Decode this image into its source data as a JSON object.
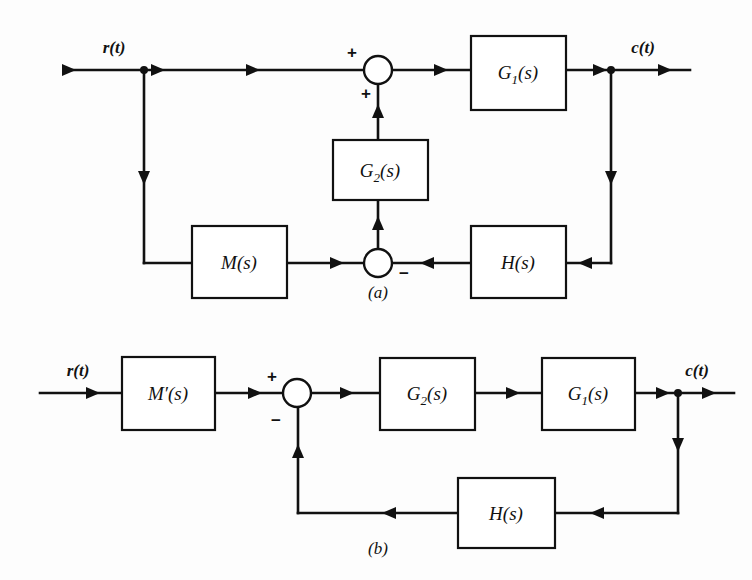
{
  "figure": {
    "background_color": "#fdfdfd",
    "line_color": "#111111",
    "block_fill": "#ffffff"
  },
  "diagram_a": {
    "caption": "(a)",
    "input_label": "r(t)",
    "output_label": "c(t)",
    "blocks": [
      {
        "id": "g1",
        "label_main": "G",
        "label_sub": "1",
        "label_tail": "(s)",
        "text": "G1(s)",
        "x": 471,
        "y": 36,
        "w": 95,
        "h": 74
      },
      {
        "id": "g2",
        "label_main": "G",
        "label_sub": "2",
        "label_tail": "(s)",
        "text": "G2(s)",
        "x": 333,
        "y": 140,
        "w": 95,
        "h": 60
      },
      {
        "id": "m",
        "label_main": "M",
        "label_sub": "",
        "label_tail": "(s)",
        "text": "M(s)",
        "x": 192,
        "y": 226,
        "w": 95,
        "h": 72
      },
      {
        "id": "h",
        "label_main": "H",
        "label_sub": "",
        "label_tail": "(s)",
        "text": "H(s)",
        "x": 471,
        "y": 226,
        "w": 95,
        "h": 72
      }
    ],
    "summing_junctions": [
      {
        "id": "sum-top",
        "cx": 378,
        "cy": 70,
        "r": 14,
        "signs": [
          {
            "text": "+",
            "x": 352,
            "y": 58
          },
          {
            "text": "+",
            "x": 366,
            "y": 99
          }
        ]
      },
      {
        "id": "sum-bottom",
        "cx": 378,
        "cy": 263,
        "r": 14,
        "signs": [
          {
            "text": "−",
            "x": 402,
            "y": 278
          }
        ]
      }
    ],
    "branch_points": [
      {
        "id": "r-branch",
        "cx": 144,
        "cy": 70
      },
      {
        "id": "c-branch",
        "cx": 611,
        "cy": 70
      }
    ]
  },
  "diagram_b": {
    "caption": "(b)",
    "input_label": "r(t)",
    "output_label": "c(t)",
    "blocks": [
      {
        "id": "mprime",
        "label_main": "M′",
        "label_sub": "",
        "label_tail": "(s)",
        "text": "M'(s)",
        "x": 122,
        "y": 357,
        "w": 93,
        "h": 73
      },
      {
        "id": "g2b",
        "label_main": "G",
        "label_sub": "2",
        "label_tail": "(s)",
        "text": "G2(s)",
        "x": 380,
        "y": 358,
        "w": 95,
        "h": 72
      },
      {
        "id": "g1b",
        "label_main": "G",
        "label_sub": "1",
        "label_tail": "(s)",
        "text": "G1(s)",
        "x": 542,
        "y": 358,
        "w": 93,
        "h": 72
      },
      {
        "id": "hb",
        "label_main": "H",
        "label_sub": "",
        "label_tail": "(s)",
        "text": "H(s)",
        "x": 458,
        "y": 478,
        "w": 97,
        "h": 70
      }
    ],
    "summing_junctions": [
      {
        "id": "sum-b",
        "cx": 297,
        "cy": 393,
        "r": 14,
        "signs": [
          {
            "text": "+",
            "x": 272,
            "y": 382
          },
          {
            "text": "−",
            "x": 276,
            "y": 424
          }
        ]
      }
    ],
    "branch_points": [
      {
        "id": "cb-branch",
        "cx": 678,
        "cy": 393
      }
    ]
  }
}
